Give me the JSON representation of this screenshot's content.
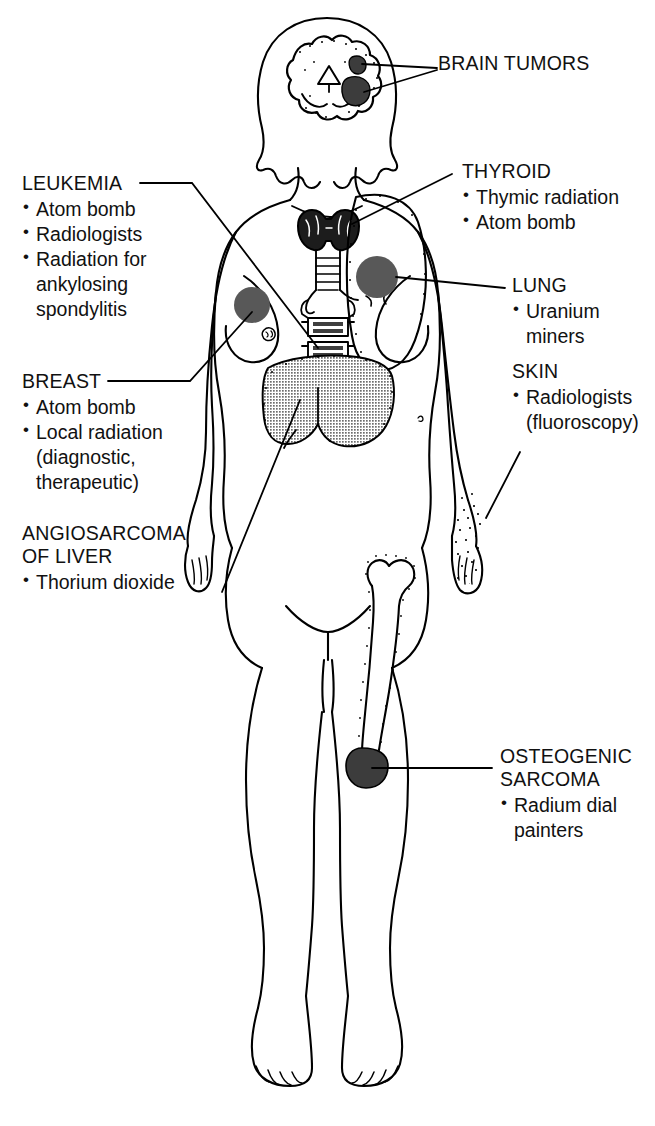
{
  "diagram": {
    "figure": "anterior view of adult female body with internal organs",
    "colors": {
      "ink": "#000000",
      "tumor_marker": "#585858",
      "liver_shading": "#8a8a8a",
      "background": "#ffffff"
    }
  },
  "labels": [
    {
      "id": "brain-tumors",
      "title": "BRAIN TUMORS",
      "items": []
    },
    {
      "id": "thyroid",
      "title": "THYROID",
      "items": [
        "Thymic radiation",
        "Atom bomb"
      ]
    },
    {
      "id": "lung",
      "title": "LUNG",
      "items": [
        "Uranium miners"
      ]
    },
    {
      "id": "skin",
      "title": "SKIN",
      "items": [
        "Radiologists",
        "(fluoroscopy)"
      ]
    },
    {
      "id": "osteogenic-sarcoma",
      "title": "OSTEOGENIC\nSARCOMA",
      "items": [
        "Radium dial",
        "painters"
      ]
    },
    {
      "id": "leukemia",
      "title": "LEUKEMIA",
      "items": [
        "Atom bomb",
        "Radiologists",
        "Radiation for",
        "ankylosing",
        "spondylitis"
      ]
    },
    {
      "id": "breast",
      "title": "BREAST",
      "items": [
        "Atom bomb",
        "Local radiation",
        "(diagnostic,",
        "therapeutic)"
      ]
    },
    {
      "id": "angiosarcoma-of-liver",
      "title": "ANGIOSARCOMA\nOF LIVER",
      "items": [
        "Thorium dioxide"
      ]
    }
  ],
  "label_text": {
    "brain_tumors_title": "BRAIN TUMORS",
    "thyroid_title": "THYROID",
    "thyroid_i0": "Thymic radiation",
    "thyroid_i1": "Atom bomb",
    "lung_title": "LUNG",
    "lung_i0": "Uranium miners",
    "skin_title": "SKIN",
    "skin_i0": "Radiologists",
    "skin_i1": "(fluoroscopy)",
    "osteo_title": "OSTEOGENIC\nSARCOMA",
    "osteo_i0": "Radium dial",
    "osteo_i1": "painters",
    "leukemia_title": "LEUKEMIA",
    "leukemia_i0": "Atom bomb",
    "leukemia_i1": "Radiologists",
    "leukemia_i2": "Radiation for",
    "leukemia_i3": "ankylosing",
    "leukemia_i4": "spondylitis",
    "breast_title": "BREAST",
    "breast_i0": "Atom bomb",
    "breast_i1": "Local radiation",
    "breast_i2": "(diagnostic,",
    "breast_i3": "therapeutic)",
    "liver_title": "ANGIOSARCOMA\nOF LIVER",
    "liver_i0": "Thorium dioxide"
  },
  "markers": [
    {
      "id": "brain-tumor-marker-upper",
      "site": "brain",
      "shape": "blob"
    },
    {
      "id": "brain-tumor-marker-lower",
      "site": "brain",
      "shape": "blob"
    },
    {
      "id": "lung-tumor-marker",
      "site": "lung",
      "shape": "circle"
    },
    {
      "id": "breast-tumor-marker",
      "site": "breast",
      "shape": "circle"
    },
    {
      "id": "femur-tumor-marker",
      "site": "distal femur",
      "shape": "blob"
    },
    {
      "id": "liver-shaded-organ",
      "site": "liver",
      "shape": "stippled-region"
    },
    {
      "id": "skin-stipple-hand",
      "site": "hand",
      "shape": "stipple"
    }
  ]
}
